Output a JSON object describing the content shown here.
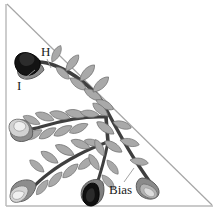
{
  "figure": {
    "background_color": "#ffffff",
    "frame": {
      "border_color": "#b8b8b8",
      "hypotenuse_color": "#a6a6a6",
      "left_edge": "vertical",
      "bottom_edge": "horizontal",
      "diagonal": "top-left to bottom-right"
    },
    "labels": [
      {
        "id": "H",
        "text": "H",
        "x": 41,
        "y": 45,
        "leader_to": "upper-branch-leaf"
      },
      {
        "id": "I",
        "text": "I",
        "x": 17,
        "y": 79,
        "leader_to": "upper-left-flower"
      },
      {
        "id": "Bias",
        "text": "Bias",
        "x": 109,
        "y": 183,
        "leader_to": "lower-right-leaf"
      }
    ],
    "colors": {
      "branch_dark": "#3f3f3f",
      "branch_mid": "#555555",
      "leaf_fill": "#a9a9a9",
      "leaf_stroke": "#6e6e6e",
      "flower_dark": "#111111",
      "flower_mid": "#777777",
      "flower_light": "#d6d6d6",
      "sepal_fill": "#8a8a8a",
      "leader_line": "#9a9a9a",
      "text": "#1a1a1a"
    },
    "structure": {
      "junction_point": {
        "x": 105,
        "y": 105
      },
      "branches": [
        {
          "name": "upper-left-branch",
          "terminal_flower": "black-bud",
          "leaf_count": 8
        },
        {
          "name": "middle-left-branch",
          "terminal_flower": "light-bud",
          "leaf_count": 9
        },
        {
          "name": "lower-branch",
          "terminal_flower": "black-bud",
          "leaf_count": 9
        },
        {
          "name": "lower-right-branch",
          "terminal_flower": "gray-bud",
          "leaf_count": 6
        }
      ],
      "flowers": [
        {
          "name": "upper-left-flower",
          "x": 30,
          "y": 62,
          "shade": "black"
        },
        {
          "name": "mid-left-flower",
          "x": 22,
          "y": 128,
          "shade": "light"
        },
        {
          "name": "bottom-left-flower",
          "x": 22,
          "y": 196,
          "shade": "light"
        },
        {
          "name": "bottom-center-flower",
          "x": 90,
          "y": 196,
          "shade": "black"
        },
        {
          "name": "bottom-right-flower",
          "x": 150,
          "y": 188,
          "shade": "gray"
        }
      ]
    }
  }
}
